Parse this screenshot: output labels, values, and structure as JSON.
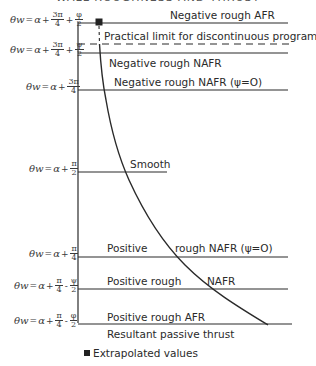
{
  "title_partial": "WALL ROUGHNESS AND THRUST",
  "diagram": {
    "zones": [
      {
        "label": "Negative rough AFR",
        "formula": {
          "lhs": "θw",
          "a": "α",
          "t1": {
            "num": "3π",
            "den": "4"
          },
          "op": "+",
          "t2": {
            "num": "φ",
            "den": "2"
          }
        }
      },
      {
        "label": "Practical limit for discontinuous programme"
      },
      {
        "label": "Negative rough NAFR",
        "formula": {
          "lhs": "θw",
          "a": "α",
          "t1": {
            "num": "3π",
            "den": "4"
          },
          "op": "+",
          "t2": {
            "num": "ψ",
            "den": "2"
          }
        }
      },
      {
        "label": "Negative rough NAFR (ψ=O)",
        "formula": {
          "lhs": "θw",
          "a": "α",
          "t1": {
            "num": "3π",
            "den": "4"
          }
        }
      },
      {
        "label": "Smooth",
        "formula": {
          "lhs": "θw",
          "a": "α",
          "t1": {
            "num": "π",
            "den": "2"
          }
        }
      },
      {
        "label_left": "Positive",
        "label_right": "rough NAFR (ψ=O)",
        "formula": {
          "lhs": "θw",
          "a": "α",
          "t1": {
            "num": "π",
            "den": "4"
          }
        }
      },
      {
        "label_left": "Positive rough",
        "label_right": "NAFR",
        "formula": {
          "lhs": "θw",
          "a": "α",
          "t1": {
            "num": "π",
            "den": "4"
          },
          "op": "-",
          "t2": {
            "num": "ψ",
            "den": "2"
          }
        }
      },
      {
        "label": "Positive rough AFR",
        "formula": {
          "lhs": "θw",
          "a": "α",
          "t1": {
            "num": "π",
            "den": "4"
          },
          "op": "-",
          "t2": {
            "num": "φ",
            "den": "2"
          }
        }
      }
    ],
    "x_axis_label": "Resultant passive thrust",
    "legend": {
      "marker": "filled-square",
      "label": "Extrapolated values"
    },
    "colors": {
      "line": "#2a2a2a",
      "background": "#ffffff"
    }
  }
}
